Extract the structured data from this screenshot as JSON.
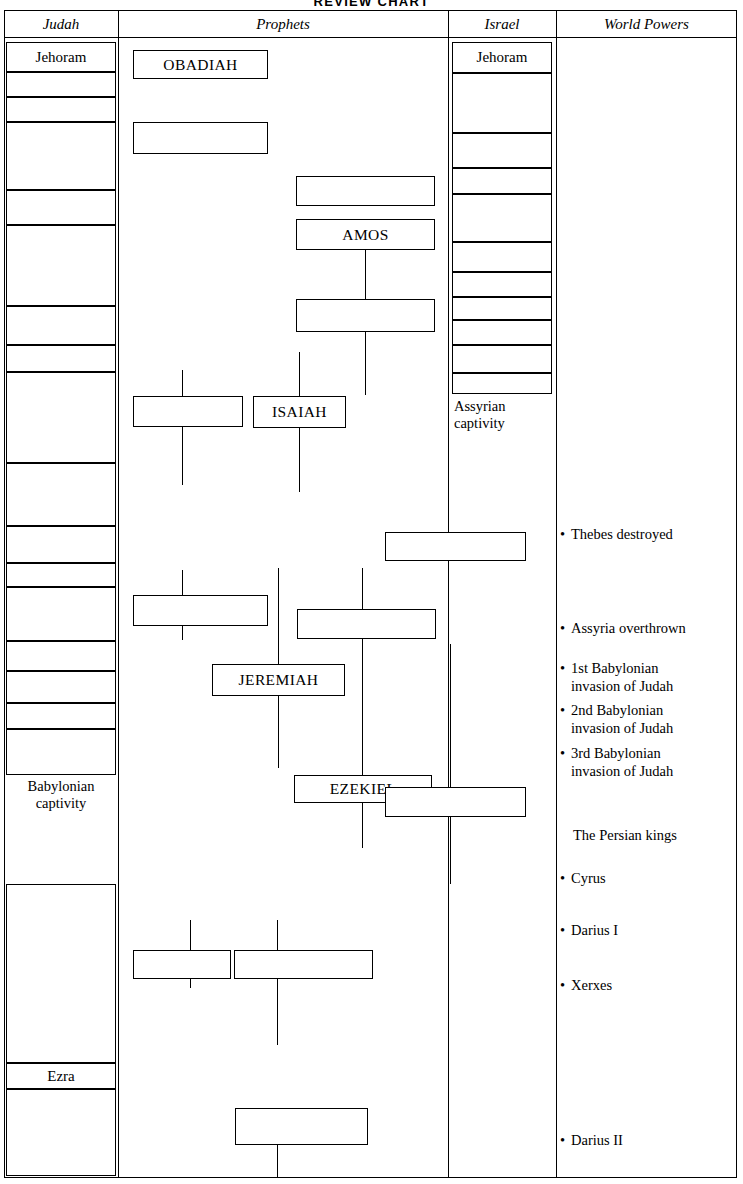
{
  "title": "REVIEW  CHART",
  "columns": [
    {
      "key": "judah",
      "label": "Judah"
    },
    {
      "key": "prophets",
      "label": "Prophets"
    },
    {
      "key": "israel",
      "label": "Israel"
    },
    {
      "key": "world_powers",
      "label": "World Powers"
    }
  ],
  "judah": {
    "label": "Judah",
    "first_king": "Jehoram",
    "captivity": "Babylonian\ncaptivity",
    "captivity_line1": "Babylonian",
    "captivity_line2": "captivity",
    "ezra": "Ezra",
    "row_count": 18
  },
  "israel": {
    "label": "Israel",
    "first_king": "Jehoram",
    "captivity_line1": "Assyrian",
    "captivity_line2": "captivity",
    "row_count": 11
  },
  "prophets": {
    "label": "Prophets",
    "named_boxes": [
      "OBADIAH",
      "AMOS",
      "ISAIAH",
      "JEREMIAH",
      "EZEKIEL"
    ],
    "obadiah": "OBADIAH",
    "amos": "AMOS",
    "isaiah": "ISAIAH",
    "jeremiah": "JEREMIAH",
    "ezekiel": "EZEKIEL",
    "unlabeled_box_count": 10
  },
  "world_powers": {
    "label": "World Powers",
    "events": [
      {
        "bullet": "•",
        "text": "Thebes destroyed"
      },
      {
        "bullet": "•",
        "text": "Assyria overthrown"
      },
      {
        "bullet": "•",
        "text": "1st Babylonian\ninvasion of Judah"
      },
      {
        "bullet": "•",
        "text": "2nd Babylonian\ninvasion of Judah"
      },
      {
        "bullet": "•",
        "text": "3rd Babylonian\ninvasion of Judah"
      },
      {
        "bullet": "",
        "text": "The Persian kings"
      },
      {
        "bullet": "•",
        "text": "Cyrus"
      },
      {
        "bullet": "•",
        "text": "Darius I"
      },
      {
        "bullet": "•",
        "text": "Xerxes"
      },
      {
        "bullet": "•",
        "text": "Darius II"
      }
    ],
    "e0": "Thebes destroyed",
    "e1": "Assyria overthrown",
    "e2a": "1st Babylonian",
    "e2b": "invasion of Judah",
    "e3a": "2nd Babylonian",
    "e3b": "invasion of Judah",
    "e4a": "3rd Babylonian",
    "e4b": "invasion of Judah",
    "e5": "The Persian kings",
    "e6": "Cyrus",
    "e7": "Darius I",
    "e8": "Xerxes",
    "e9": "Darius II",
    "bullet": "•"
  },
  "colors": {
    "ink": "#000000",
    "paper": "#ffffff"
  }
}
